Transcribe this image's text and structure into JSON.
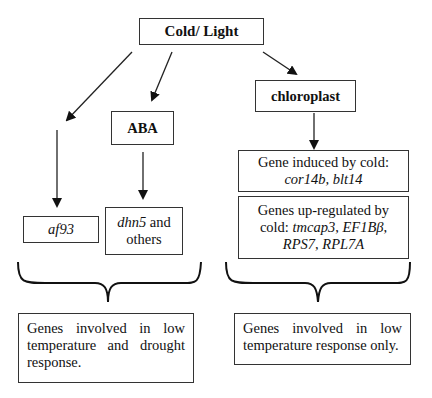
{
  "diagram": {
    "root": {
      "label": "Cold/ Light"
    },
    "aba": {
      "label": "ABA"
    },
    "chloroplast": {
      "label": "chloroplast"
    },
    "af93": {
      "label": "af93"
    },
    "dhn5": {
      "gene": "dhn5",
      "suffix": " and others"
    },
    "cold_induced": {
      "prefix": "Gene induced by cold:",
      "genes": "cor14b, blt14"
    },
    "upregulated": {
      "prefix": "Genes up-regulated by cold: ",
      "genes1": "tmcap3",
      "sep1": ", ",
      "genes2": "EF1Bβ",
      "sep2": ",",
      "genes3": "RPS7",
      "sep3": ", ",
      "genes4": "RPL7A"
    },
    "left_summary": {
      "text": "Genes involved in low temperature and drought response."
    },
    "right_summary": {
      "text": "Genes involved in low temperature response only."
    }
  }
}
